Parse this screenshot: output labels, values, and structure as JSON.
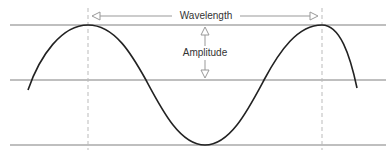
{
  "diagram": {
    "labels": {
      "wavelength": "Wavelength",
      "amplitude": "Amplitude"
    },
    "colors": {
      "wave": "#222222",
      "reference_lines": "#aaaaaa",
      "dashed_markers": "#bbbbbb",
      "arrows": "#999999",
      "text": "#333333"
    },
    "geometry": {
      "top_line_y": 25,
      "middle_line_y": 80,
      "bottom_line_y": 145,
      "crest_1_x": 88,
      "crest_2_x": 322,
      "trough_x": 205
    }
  },
  "caption": {
    "text": "",
    "note": "cropped caption line, illegible"
  }
}
